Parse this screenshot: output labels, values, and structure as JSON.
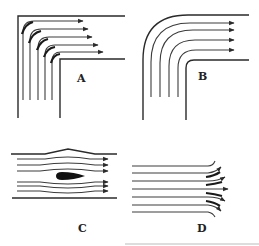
{
  "figure": {
    "panels": [
      {
        "id": "A",
        "label": "A",
        "description": "Flow around a sharp 90-degree corner with separation/vortex arcs"
      },
      {
        "id": "B",
        "label": "B",
        "description": "Flow around a rounded 90-degree bend"
      },
      {
        "id": "C",
        "label": "C",
        "description": "Channel flow around a streamlined (teardrop) body"
      },
      {
        "id": "D",
        "label": "D",
        "description": "Parallel streamlines diverging at channel exit"
      }
    ],
    "colors": {
      "line": "#2a2a2a",
      "body": "#111111",
      "background": "#ffffff"
    }
  }
}
